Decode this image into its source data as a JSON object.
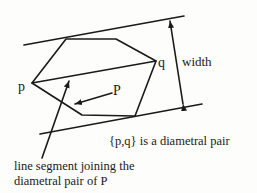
{
  "figure": {
    "labels": {
      "vertex_p": "p",
      "vertex_q": "q",
      "polygon": "P",
      "width": "width",
      "caption": "{p,q} is a diametral pair",
      "segment_line1": "line segment joining the",
      "segment_line2": "diametral pair of P"
    },
    "colors": {
      "stroke": "#1a1a1a",
      "background": "#fdfdfb"
    }
  }
}
